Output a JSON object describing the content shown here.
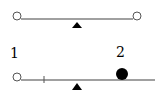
{
  "diagram": {
    "title": "",
    "seesaw_top": {
      "beam": {
        "x1": 21,
        "x2": 133,
        "y": 19,
        "color": "#808080"
      },
      "fulcrum": {
        "x": 77,
        "y_top": 22,
        "y_bottom": 28,
        "color": "#000000"
      },
      "left_weight": {
        "type": "hollow-circle",
        "cx": 17,
        "cy": 16,
        "r": 4
      },
      "right_weight": {
        "type": "hollow-circle",
        "cx": 137,
        "cy": 16,
        "r": 4
      }
    },
    "seesaw_bottom": {
      "beam": {
        "x1": 21,
        "x2": 155,
        "y": 80,
        "color": "#808080"
      },
      "tick": {
        "x": 44
      },
      "fulcrum": {
        "x": 77,
        "y_top": 83,
        "y_bottom": 90,
        "color": "#000000"
      },
      "weights": [
        {
          "label": "1",
          "type": "hollow-circle",
          "cx": 17,
          "cy": 77,
          "r": 4,
          "label_x": 10,
          "label_y": 58
        },
        {
          "label": "2",
          "type": "filled-circle",
          "cx": 122,
          "cy": 74,
          "r": 6,
          "label_x": 116,
          "label_y": 57
        }
      ]
    }
  }
}
